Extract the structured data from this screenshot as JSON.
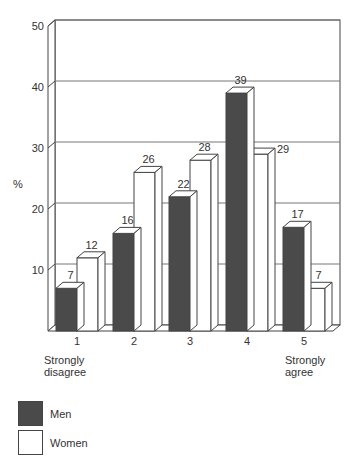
{
  "chart_data": {
    "type": "bar",
    "style": "3d-clustered",
    "title": "",
    "xlabel": "",
    "ylabel": "%",
    "ylim": [
      0,
      50
    ],
    "yticks": [
      10,
      20,
      30,
      40,
      50
    ],
    "grid": true,
    "categories": [
      "1",
      "2",
      "3",
      "4",
      "5"
    ],
    "category_annotations": {
      "1": "Strongly disagree",
      "5": "Strongly agree"
    },
    "series": [
      {
        "name": "Men",
        "color": "#4a4a4a",
        "values": [
          7,
          16,
          22,
          39,
          17
        ]
      },
      {
        "name": "Women",
        "color": "#ffffff",
        "values": [
          12,
          26,
          28,
          29,
          7
        ]
      }
    ],
    "legend_position": "bottom-left"
  },
  "axis": {
    "ylabel": "%",
    "yticks": [
      "10",
      "20",
      "30",
      "40",
      "50"
    ],
    "xticks": [
      "1",
      "2",
      "3",
      "4",
      "5"
    ],
    "low_anchor": [
      "Strongly",
      "disagree"
    ],
    "high_anchor": [
      "Strongly",
      "agree"
    ]
  },
  "legend": {
    "men": "Men",
    "women": "Women"
  }
}
